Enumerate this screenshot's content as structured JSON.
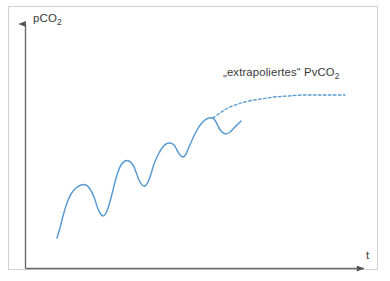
{
  "figure": {
    "background_color": "#ffffff",
    "frame_color": "#d0d0d0",
    "axis_color": "#555555",
    "curve_color": "#5a9bd1",
    "text_color": "#3a3a3a"
  },
  "labels": {
    "y_axis": "pCO",
    "y_axis_sub": "2",
    "x_axis": "t",
    "curve_annotation": "„extrapoliertes“ PvCO",
    "curve_annotation_sub": "2",
    "curve_annotation_full": "„extrapoliertes“ PvCO₂"
  },
  "chart_data": {
    "type": "line",
    "title": "",
    "xlabel": "t",
    "ylabel": "pCO2",
    "grid": false,
    "legend": "none",
    "axis_style": "arrow",
    "xlim": [
      0,
      1
    ],
    "ylim": [
      0,
      1
    ],
    "annotations": [
      {
        "text": "„extrapoliertes“ PvCO₂",
        "x_px": 223,
        "y_px": 66,
        "points_to_series": "extrapolated-pvco2"
      }
    ],
    "series": [
      {
        "name": "measured-pco2",
        "style": "solid",
        "color": "#5a9bd1",
        "description": "Oscillating sawtooth-like signal rising over time",
        "points_px": [
          [
            57,
            238
          ],
          [
            60,
            228
          ],
          [
            63,
            216
          ],
          [
            67,
            203
          ],
          [
            71,
            194
          ],
          [
            76,
            188
          ],
          [
            81,
            185
          ],
          [
            86,
            185
          ],
          [
            90,
            189
          ],
          [
            94,
            197
          ],
          [
            97,
            206
          ],
          [
            100,
            213
          ],
          [
            103,
            216
          ],
          [
            106,
            213
          ],
          [
            109,
            205
          ],
          [
            112,
            194
          ],
          [
            115,
            182
          ],
          [
            118,
            172
          ],
          [
            121,
            165
          ],
          [
            125,
            161
          ],
          [
            129,
            161
          ],
          [
            133,
            165
          ],
          [
            136,
            172
          ],
          [
            139,
            180
          ],
          [
            142,
            185
          ],
          [
            145,
            186
          ],
          [
            148,
            182
          ],
          [
            151,
            174
          ],
          [
            154,
            164
          ],
          [
            158,
            155
          ],
          [
            162,
            148
          ],
          [
            166,
            144
          ],
          [
            170,
            143
          ],
          [
            174,
            145
          ],
          [
            177,
            150
          ],
          [
            180,
            155
          ],
          [
            183,
            157
          ],
          [
            186,
            154
          ],
          [
            189,
            147
          ],
          [
            193,
            138
          ],
          [
            197,
            130
          ],
          [
            201,
            124
          ],
          [
            205,
            120
          ],
          [
            209,
            118
          ],
          [
            213,
            118
          ],
          [
            216,
            122
          ],
          [
            219,
            128
          ],
          [
            222,
            132
          ],
          [
            226,
            134
          ],
          [
            230,
            132
          ],
          [
            234,
            128
          ],
          [
            238,
            124
          ],
          [
            241,
            121
          ]
        ]
      },
      {
        "name": "extrapolated-pvco2",
        "style": "dashed",
        "color": "#5a9bd1",
        "description": "Dashed extrapolation branching from the final peak, flattening asymptotically",
        "points_px": [
          [
            213,
            118
          ],
          [
            220,
            113
          ],
          [
            228,
            108
          ],
          [
            238,
            104
          ],
          [
            249,
            101
          ],
          [
            261,
            99
          ],
          [
            274,
            97
          ],
          [
            288,
            96
          ],
          [
            302,
            95
          ],
          [
            316,
            95
          ],
          [
            330,
            95
          ],
          [
            345,
            95
          ]
        ]
      }
    ]
  }
}
